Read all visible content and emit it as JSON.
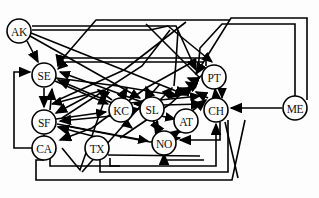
{
  "diagram": {
    "background_color": "#fdfdfd",
    "edge_color": "#000000",
    "node_fill": "#ffffff",
    "node_stroke": "#000000",
    "node_radius": 12,
    "node_stroke_width": 1.6,
    "edge_width": 1.6,
    "arrow_size": 7,
    "nodes": [
      {
        "id": "AK",
        "label": "AK",
        "x": 19,
        "y": 31
      },
      {
        "id": "SE",
        "label": "SE",
        "x": 44,
        "y": 75
      },
      {
        "id": "SF",
        "label": "SF",
        "x": 44,
        "y": 122
      },
      {
        "id": "CA",
        "label": "CA",
        "x": 44,
        "y": 148
      },
      {
        "id": "TX",
        "label": "TX",
        "x": 97,
        "y": 148
      },
      {
        "id": "KC",
        "label": "KC",
        "x": 121,
        "y": 110
      },
      {
        "id": "SL",
        "label": "SL",
        "x": 152,
        "y": 109
      },
      {
        "id": "NO",
        "label": "NO",
        "x": 164,
        "y": 143
      },
      {
        "id": "AT",
        "label": "AT",
        "x": 186,
        "y": 121
      },
      {
        "id": "PT",
        "label": "PT",
        "x": 214,
        "y": 77
      },
      {
        "id": "CH",
        "label": "CH",
        "x": 216,
        "y": 110
      },
      {
        "id": "ME",
        "label": "ME",
        "x": 295,
        "y": 108
      }
    ],
    "edges": [
      {
        "from": "AK",
        "to": "SE"
      },
      {
        "from": "AK",
        "to": "CH"
      },
      {
        "from": "AK",
        "to": "PT"
      },
      {
        "from": "AK",
        "to": "SL"
      },
      {
        "from": "SE",
        "to": "SF"
      },
      {
        "from": "SE",
        "to": "KC"
      },
      {
        "from": "SE",
        "to": "CH"
      },
      {
        "from": "SF",
        "to": "SE"
      },
      {
        "from": "SF",
        "to": "KC"
      },
      {
        "from": "SF",
        "to": "NO"
      },
      {
        "from": "CA",
        "to": "SF"
      },
      {
        "from": "CA",
        "to": "SE"
      },
      {
        "from": "CA",
        "to": "CH"
      },
      {
        "from": "TX",
        "to": "SL"
      },
      {
        "from": "TX",
        "to": "NO"
      },
      {
        "from": "TX",
        "to": "SF"
      },
      {
        "from": "KC",
        "to": "SL"
      },
      {
        "from": "KC",
        "to": "SE"
      },
      {
        "from": "KC",
        "to": "CH"
      },
      {
        "from": "SL",
        "to": "KC"
      },
      {
        "from": "SL",
        "to": "CH"
      },
      {
        "from": "SL",
        "to": "AT"
      },
      {
        "from": "SL",
        "to": "NO"
      },
      {
        "from": "NO",
        "to": "AT"
      },
      {
        "from": "NO",
        "to": "SL"
      },
      {
        "from": "NO",
        "to": "CH"
      },
      {
        "from": "AT",
        "to": "CH"
      },
      {
        "from": "AT",
        "to": "NO"
      },
      {
        "from": "PT",
        "to": "CH"
      },
      {
        "from": "PT",
        "to": "SE"
      },
      {
        "from": "CH",
        "to": "PT"
      },
      {
        "from": "CH",
        "to": "SE"
      },
      {
        "from": "CH",
        "to": "NO"
      },
      {
        "from": "ME",
        "to": "CH"
      },
      {
        "from": "ME",
        "to": "PT"
      },
      {
        "from": "ME",
        "to": "SE"
      }
    ]
  }
}
